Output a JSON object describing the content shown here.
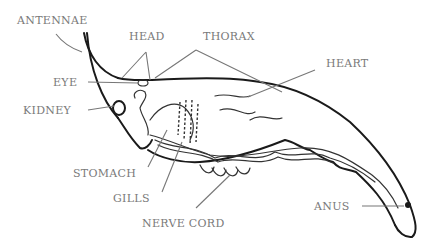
{
  "diagram": {
    "colors": {
      "outline": "#1a1a1a",
      "label": "#7a7a7a",
      "leader": "#777777"
    },
    "labels": {
      "antennae": "ANTENNAE",
      "head": "HEAD",
      "thorax": "THORAX",
      "heart": "HEART",
      "eye": "EYE",
      "kidney": "KIDNEY",
      "stomach": "STOMACH",
      "gills": "GILLS",
      "nerve_cord": "NERVE CORD",
      "anus": "ANUS"
    }
  }
}
